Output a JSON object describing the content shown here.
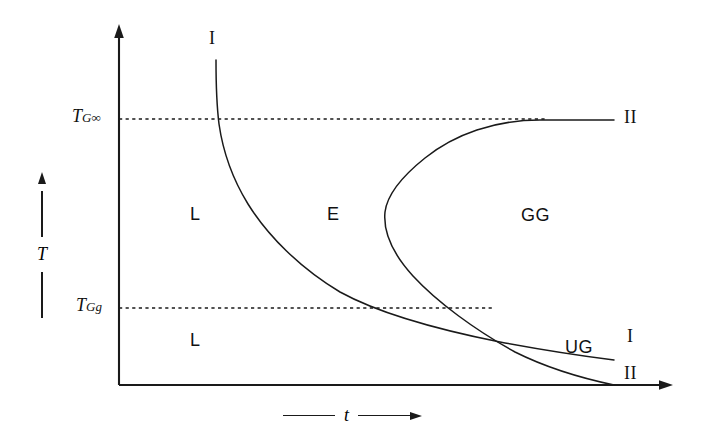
{
  "figure": {
    "type": "phase-diagram",
    "background_color": "#ffffff",
    "ink_color": "#1a1a1a"
  },
  "axes": {
    "y_axis": {
      "title": "T",
      "direction": "up",
      "origin_px": [
        119,
        385
      ],
      "tip_px": [
        119,
        25
      ]
    },
    "x_axis": {
      "title": "t",
      "direction": "right",
      "origin_px": [
        119,
        385
      ],
      "tip_px": [
        672,
        385
      ]
    }
  },
  "ticks": [
    {
      "name": "tg-infinity",
      "symbol": "T",
      "subscript": "G∞",
      "y_px": 119,
      "dashed_to_x_px": 545
    },
    {
      "name": "tg-g",
      "symbol": "T",
      "subscript": "Gg",
      "y_px": 308,
      "dashed_to_x_px": 492
    }
  ],
  "regions": [
    {
      "label": "L",
      "x_px": 196,
      "y_px": 214
    },
    {
      "label": "E",
      "x_px": 333,
      "y_px": 214
    },
    {
      "label": "GG",
      "x_px": 533,
      "y_px": 215
    },
    {
      "label": "L",
      "x_px": 196,
      "y_px": 340
    },
    {
      "label": "UG",
      "x_px": 578,
      "y_px": 347
    }
  ],
  "curve_labels": [
    {
      "label": "I",
      "x_px": 213,
      "y_px": 40,
      "curve": "curve-one-top"
    },
    {
      "label": "II",
      "x_px": 629,
      "y_px": 118,
      "curve": "curve-two-upper-branch"
    },
    {
      "label": "I",
      "x_px": 629,
      "y_px": 337,
      "curve": "curve-one-lower-tail"
    },
    {
      "label": "II",
      "x_px": 629,
      "y_px": 374,
      "curve": "curve-two-lower-branch"
    }
  ],
  "curves": [
    {
      "name": "curve-one",
      "roman": "I",
      "description": "Steeply descending curve entering at top, flattening to the right and exiting lower right",
      "path": "M 216 60 C 216 95 217 108 219 124 C 223 152 232 178 248 204 C 268 236 300 268 340 292 C 380 314 440 330 500 342 C 548 351 590 357 614 360"
    },
    {
      "name": "curve-two",
      "roman": "II",
      "description": "C-shaped nose curve opening to the right with leftmost vertex mid-height",
      "path": "M 614 120 C 586 120 560 120 540 120 C 495 120 455 134 425 158 C 400 178 387 196 385 212 C 383 232 393 254 413 276 C 437 302 475 330 515 352 C 555 372 595 381 614 385"
    }
  ],
  "y_caption": {
    "title": "T"
  },
  "x_caption": {
    "title": "t"
  }
}
